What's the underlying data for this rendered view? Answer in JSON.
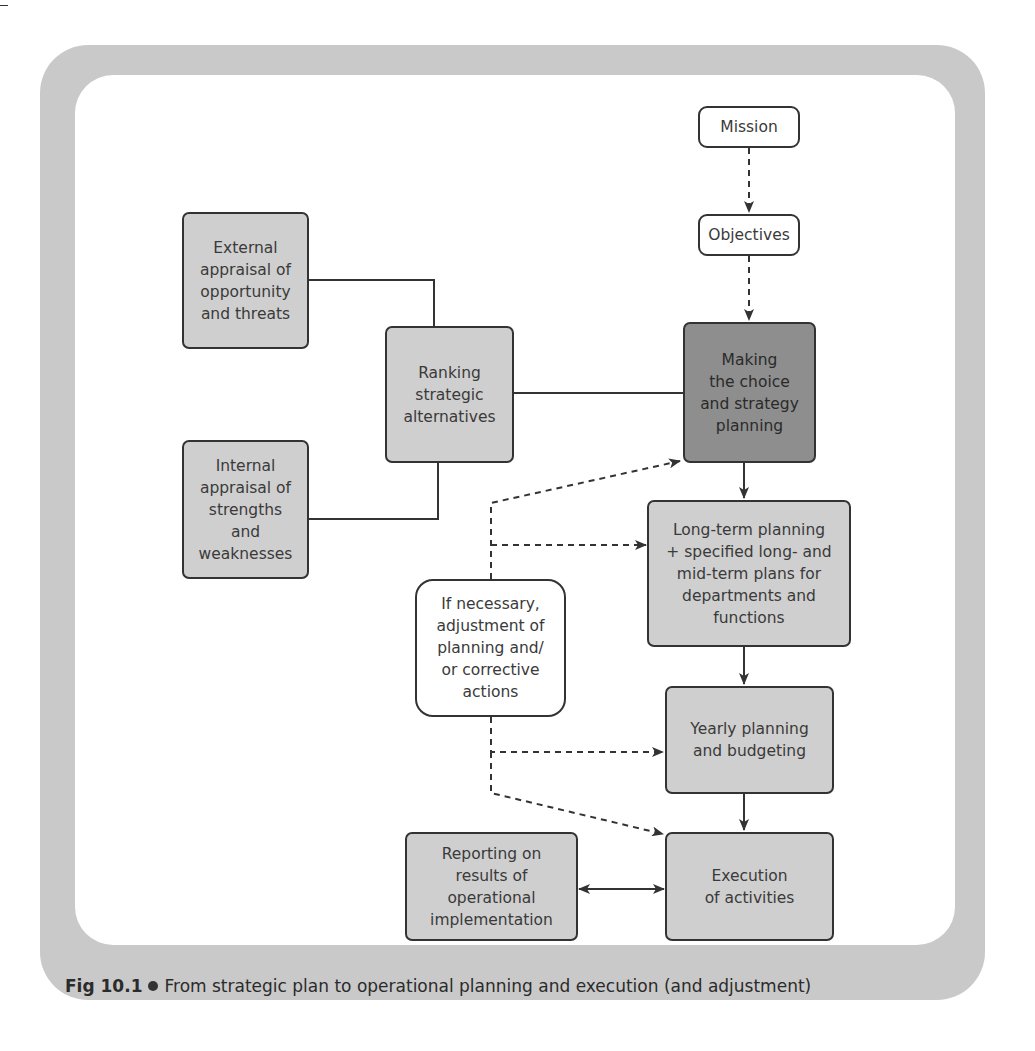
{
  "figure": {
    "label": "Fig 10.1",
    "caption": "From strategic plan to operational planning and execution (and adjustment)"
  },
  "nodes": {
    "mission": "Mission",
    "objectives": "Objectives",
    "external": "External\nappraisal of\nopportunity\nand threats",
    "internal": "Internal\nappraisal of\nstrengths\nand\nweaknesses",
    "ranking": "Ranking\nstrategic\nalternatives",
    "choice": "Making\nthe choice\nand strategy\nplanning",
    "longterm": "Long-term planning\n+ specified long- and\nmid-term plans for\ndepartments and\nfunctions",
    "adjust": "If necessary,\nadjustment of\nplanning and/\nor corrective\nactions",
    "yearly": "Yearly planning\nand budgeting",
    "execution": "Execution\nof activities",
    "reporting": "Reporting on\nresults of\noperational\nimplementation"
  },
  "edges": [
    {
      "from": "mission",
      "to": "objectives",
      "style": "dashed",
      "arrow": "end"
    },
    {
      "from": "objectives",
      "to": "choice",
      "style": "dashed",
      "arrow": "end"
    },
    {
      "from": "external",
      "to": "ranking",
      "style": "solid",
      "arrow": "none"
    },
    {
      "from": "internal",
      "to": "ranking",
      "style": "solid",
      "arrow": "none"
    },
    {
      "from": "ranking",
      "to": "choice",
      "style": "solid",
      "arrow": "none"
    },
    {
      "from": "choice",
      "to": "longterm",
      "style": "solid",
      "arrow": "end"
    },
    {
      "from": "longterm",
      "to": "yearly",
      "style": "solid",
      "arrow": "end"
    },
    {
      "from": "yearly",
      "to": "execution",
      "style": "solid",
      "arrow": "end"
    },
    {
      "from": "execution",
      "to": "reporting",
      "style": "solid",
      "arrow": "both"
    },
    {
      "from": "adjust",
      "to": "choice",
      "style": "dashed",
      "arrow": "end"
    },
    {
      "from": "adjust",
      "to": "longterm",
      "style": "dashed",
      "arrow": "end"
    },
    {
      "from": "adjust",
      "to": "yearly",
      "style": "dashed",
      "arrow": "end"
    },
    {
      "from": "adjust",
      "to": "execution",
      "style": "dashed",
      "arrow": "end"
    }
  ],
  "colors": {
    "frame": "#c9c9c9",
    "box_fill": "#cfcfcf",
    "highlight_fill": "#8e8e8e",
    "line": "#333333"
  }
}
